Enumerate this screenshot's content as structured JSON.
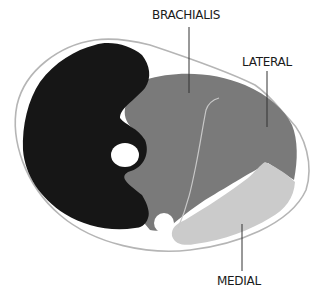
{
  "diagram": {
    "labels": {
      "brachialis": "BRACHIALIS",
      "lateral": "LATERAL",
      "medial": "MEDIAL"
    },
    "regions": [
      {
        "name": "biceps-region",
        "color": "#161616"
      },
      {
        "name": "brachialis-region",
        "color": "#7a7a7a"
      },
      {
        "name": "lateral-region",
        "color": "#7a7a7a"
      },
      {
        "name": "medial-region",
        "color": "#cbcbcb"
      },
      {
        "name": "bone",
        "color": "#ffffff"
      }
    ],
    "colors": {
      "outline": "#b5b5b5",
      "divider": "#c8c8c8",
      "leader": "#333333",
      "text": "#1a1a1a"
    }
  }
}
